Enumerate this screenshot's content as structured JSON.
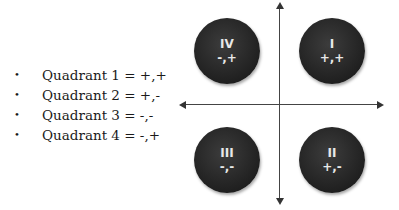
{
  "legend": {
    "items": [
      {
        "label": "Quadrant 1 = +,+"
      },
      {
        "label": "Quadrant 2 = +,-"
      },
      {
        "label": "Quadrant 3 = -,-"
      },
      {
        "label": "Quadrant 4 = -,+"
      }
    ],
    "bullet": "•"
  },
  "quadrants": {
    "iv": {
      "numeral": "IV",
      "signs": "-,+"
    },
    "i": {
      "numeral": "I",
      "signs": "+,+"
    },
    "iii": {
      "numeral": "III",
      "signs": "-,-"
    },
    "ii": {
      "numeral": "II",
      "signs": "+,-"
    }
  },
  "colors": {
    "circle": "#262626",
    "circle_text": "#e8e8e8",
    "axis": "#444444",
    "text": "#1a1a1a"
  }
}
